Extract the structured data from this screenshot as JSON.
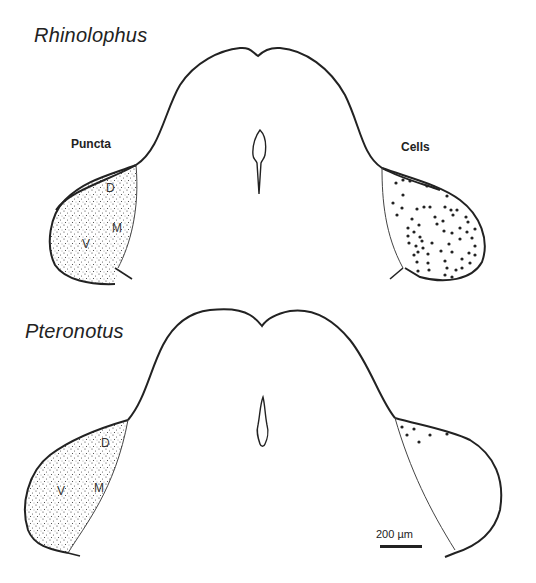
{
  "panels": [
    {
      "species": "Rhinolophus",
      "left_label": "Puncta",
      "right_label": "Cells",
      "regions": {
        "dorsal": "D",
        "medial": "M",
        "ventral": "V"
      }
    },
    {
      "species": "Pteronotus",
      "regions": {
        "dorsal": "D",
        "medial": "M",
        "ventral": "V"
      }
    }
  ],
  "scale_bar": {
    "label": "200 µm"
  },
  "colors": {
    "ink": "#222222",
    "background": "#ffffff"
  }
}
